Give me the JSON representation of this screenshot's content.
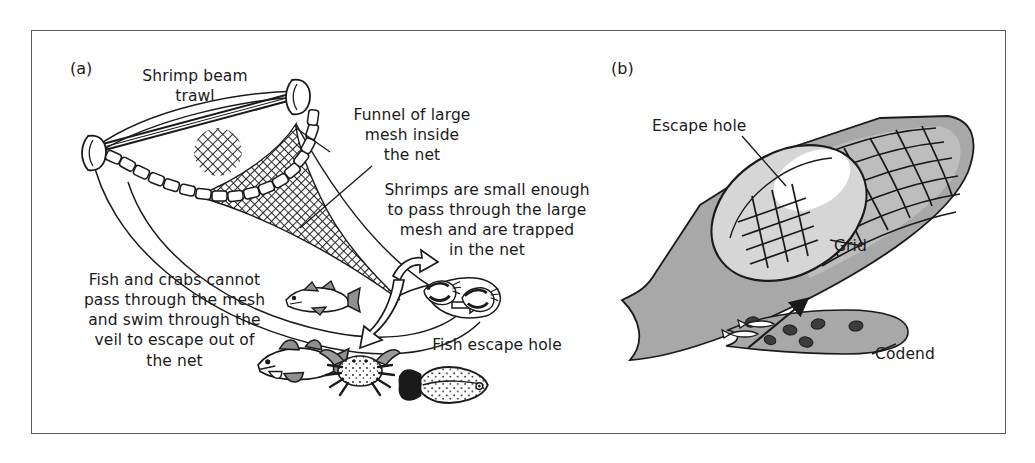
{
  "figure": {
    "background_color": "#ffffff",
    "frame_color": "#5b5b5b",
    "net_fill": "#a8a8a8",
    "net_fill_light": "#cfcfcf",
    "ink": "#1a1a1a"
  },
  "panels": [
    {
      "tag": "(a)",
      "title": "Shrimp beam trawl",
      "labels": {
        "beam_trawl": "Shrimp beam\ntrawl",
        "funnel": "Funnel of large\nmesh inside\nthe net",
        "shrimps": "Shrimps are small enough\nto pass through the large\nmesh and are trapped\nin the net",
        "fish_crabs": "Fish and crabs cannot\npass through the mesh\nand swim through the\nveil to escape out of\nthe net",
        "fish_escape_hole": "Fish escape hole"
      },
      "animals": [
        "fish",
        "fish",
        "crab",
        "flatfish",
        "shrimp",
        "shrimp"
      ]
    },
    {
      "tag": "(b)",
      "title": "Codend with escape grid",
      "labels": {
        "escape_hole": "Escape hole",
        "grid": "Grid",
        "codend": "Codend"
      },
      "animals": [
        "fish",
        "fish",
        "shrimp",
        "shrimp",
        "shrimp",
        "shrimp",
        "shrimp",
        "shrimp"
      ]
    }
  ]
}
